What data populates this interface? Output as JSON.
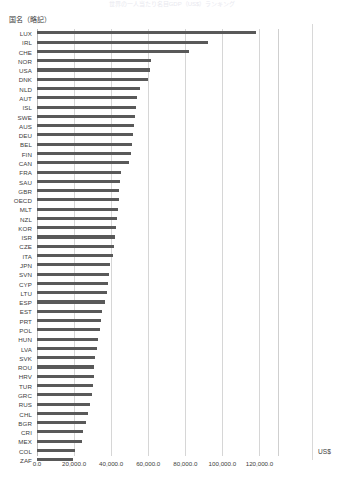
{
  "header": {
    "clipped_title": "世界の一人当たり名目GDP（US$）ランキング"
  },
  "axis": {
    "y_title": "国名（略記）",
    "unit_label": "US$",
    "x_ticks": [
      "0.0",
      "20,000.0",
      "40,000.0",
      "60,000.0",
      "80,000.0",
      "100,000.0",
      "120,000.0"
    ]
  },
  "colors": {
    "bar": "#595959",
    "gridline": "#d6d6d6",
    "axis_line": "#b9b9b9",
    "text": "#404040",
    "background": "#ffffff"
  },
  "chart_data": {
    "type": "bar",
    "orientation": "horizontal",
    "title": "世界の一人当たり名目GDP（US$）ランキング",
    "xlabel": "US$",
    "ylabel": "国名（略記）",
    "xlim": [
      0,
      130000
    ],
    "grid": true,
    "legend": "none",
    "xtick_values": [
      0,
      20000,
      40000,
      60000,
      80000,
      100000,
      120000
    ],
    "categories": [
      "LUX",
      "IRL",
      "CHE",
      "NOR",
      "USA",
      "DNK",
      "NLD",
      "AUT",
      "ISL",
      "SWE",
      "AUS",
      "DEU",
      "BEL",
      "FIN",
      "CAN",
      "FRA",
      "SAU",
      "GBR",
      "OECD",
      "MLT",
      "NZL",
      "KOR",
      "ISR",
      "CZE",
      "ITA",
      "JPN",
      "SVN",
      "CYP",
      "LTU",
      "ESP",
      "EST",
      "PRT",
      "POL",
      "HUN",
      "LVA",
      "SVK",
      "ROU",
      "HRV",
      "TUR",
      "GRC",
      "RUS",
      "CHL",
      "BGR",
      "CRI",
      "MEX",
      "COL",
      "ZAF"
    ],
    "values": [
      118000,
      92000,
      82000,
      61500,
      61000,
      60000,
      55500,
      54000,
      53500,
      53000,
      52500,
      52000,
      51000,
      50500,
      49500,
      45500,
      45000,
      44500,
      44000,
      43500,
      43000,
      42500,
      42000,
      41500,
      41000,
      39500,
      39000,
      38500,
      38000,
      36500,
      35000,
      34500,
      34000,
      33000,
      32500,
      31500,
      31000,
      30500,
      30000,
      29500,
      28500,
      27500,
      26500,
      25000,
      24500,
      20500,
      19500
    ]
  }
}
